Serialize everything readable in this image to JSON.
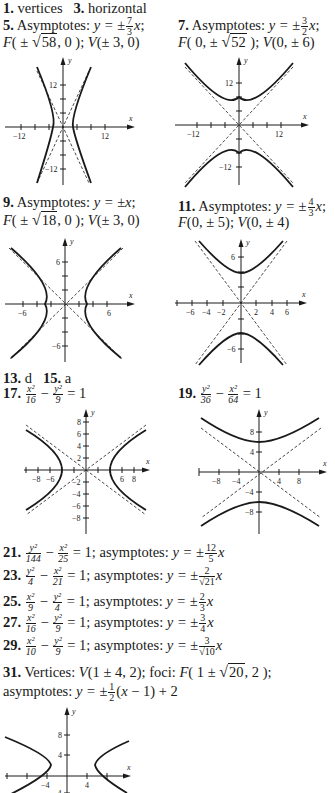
{
  "answers": [
    {
      "id": "1",
      "label": "1.",
      "text": "vertices"
    },
    {
      "id": "3",
      "label": "3.",
      "text": "horizontal"
    },
    {
      "id": "5",
      "label": "5.",
      "line1": "Asymptotes: y = ± 7/3 x;",
      "line2": "F(± √58, 0); V(± 3, 0)",
      "asym_num": "7",
      "asym_den": "3",
      "focus_root": "58",
      "vertex": "± 3, 0"
    },
    {
      "id": "7",
      "label": "7.",
      "line1": "Asymptotes: y = ± 3/2 x;",
      "line2": "F(0, ± √52); V(0, ± 6)",
      "asym_num": "3",
      "asym_den": "2",
      "focus_root": "52",
      "vertex": "0, ± 6"
    },
    {
      "id": "9",
      "label": "9.",
      "line1": "Asymptotes: y = ± x;",
      "line2": "F(± √18, 0); V(± 3, 0)",
      "focus_root": "18",
      "vertex": "± 3, 0"
    },
    {
      "id": "11",
      "label": "11.",
      "line1": "Asymptotes: y = ± 4/3 x;",
      "line2": "F(0, ± 5); V(0, ± 4)",
      "asym_num": "4",
      "asym_den": "3",
      "focus": "0, ± 5",
      "vertex": "0, ± 4"
    },
    {
      "id": "13",
      "label": "13.",
      "text": "d"
    },
    {
      "id": "15",
      "label": "15.",
      "text": "a"
    },
    {
      "id": "17",
      "label": "17.",
      "equation": "x²/16 − y²/9 = 1",
      "a_num": "x²",
      "a_den": "16",
      "b_num": "y²",
      "b_den": "9",
      "rhs": "= 1"
    },
    {
      "id": "19",
      "label": "19.",
      "equation": "y²/36 − x²/64 = 1",
      "a_num": "y²",
      "a_den": "36",
      "b_num": "x²",
      "b_den": "64",
      "rhs": "= 1"
    },
    {
      "id": "21",
      "label": "21.",
      "equation": "y²/144 − x²/25 = 1",
      "a_num": "y²",
      "a_den": "144",
      "b_num": "x²",
      "b_den": "25",
      "rhs": "= 1; asymptotes:",
      "asym": "y = ± 12/5 x",
      "asym_num": "12",
      "asym_den": "5"
    },
    {
      "id": "23",
      "label": "23.",
      "equation": "y²/4 − x²/21 = 1",
      "a_num": "y²",
      "a_den": "4",
      "b_num": "x²",
      "b_den": "21",
      "rhs": "= 1; asymptotes:",
      "asym": "y = ± 2/√21 x",
      "asym_num": "2",
      "asym_den": "√21"
    },
    {
      "id": "25",
      "label": "25.",
      "equation": "x²/9 − y²/4 = 1",
      "a_num": "x²",
      "a_den": "9",
      "b_num": "y²",
      "b_den": "4",
      "rhs": "= 1; asymptotes:",
      "asym": "y = ± 2/3 x",
      "asym_num": "2",
      "asym_den": "3"
    },
    {
      "id": "27",
      "label": "27.",
      "equation": "x²/16 − y²/9 = 1",
      "a_num": "x²",
      "a_den": "16",
      "b_num": "y²",
      "b_den": "9",
      "rhs": "= 1; asymptotes:",
      "asym": "y = ± 3/4 x",
      "asym_num": "3",
      "asym_den": "4"
    },
    {
      "id": "29",
      "label": "29.",
      "equation": "x²/10 − y²/9 = 1",
      "a_num": "x²",
      "a_den": "10",
      "b_num": "y²",
      "b_den": "9",
      "rhs": "= 1; asymptotes:",
      "asym": "y = ± 3/√10 x",
      "asym_num": "3",
      "asym_den": "√10"
    },
    {
      "id": "31",
      "label": "31.",
      "line1": "Vertices: V(1 ± 4, 2); foci: F(1 ± √20, 2);",
      "line2": "asymptotes: y = ± 1/2 (x − 1) + 2"
    }
  ],
  "words": {
    "asymptotes_cap": "Asymptotes:",
    "asymptotes": "asymptotes:",
    "vertices_cap": "Vertices:",
    "foci": "foci:",
    "y_eq": "y =",
    "pm": "±",
    "minus": "−",
    "x": "x",
    "y": "y"
  },
  "graphs": [
    {
      "id": "g5",
      "problem": "5",
      "orientation": "horizontal",
      "x_ticks": [
        "−12",
        "12"
      ],
      "y_ticks": [
        "12",
        "−12"
      ],
      "x_label": "x",
      "y_label": "y"
    },
    {
      "id": "g7",
      "problem": "7",
      "orientation": "vertical",
      "x_ticks": [
        "−12",
        "12"
      ],
      "y_ticks": [
        "12",
        "−12"
      ],
      "x_label": "x",
      "y_label": "y"
    },
    {
      "id": "g9",
      "problem": "9",
      "orientation": "horizontal",
      "x_ticks": [
        "−6",
        "6"
      ],
      "y_ticks": [
        "6",
        "−6"
      ],
      "x_label": "x",
      "y_label": "y"
    },
    {
      "id": "g11",
      "problem": "11",
      "orientation": "vertical",
      "x_ticks": [
        "−6",
        "−4",
        "−2",
        "2",
        "4",
        "6"
      ],
      "y_ticks": [
        "6",
        "−6"
      ],
      "x_label": "x",
      "y_label": "y"
    },
    {
      "id": "g17",
      "problem": "17",
      "orientation": "horizontal",
      "x_ticks": [
        "−8",
        "−6",
        "6",
        "8"
      ],
      "y_ticks": [
        "8",
        "6",
        "4",
        "2",
        "−2",
        "−4",
        "−6",
        "−8"
      ],
      "x_label": "x",
      "y_label": "y"
    },
    {
      "id": "g19",
      "problem": "19",
      "orientation": "vertical",
      "x_ticks": [
        "−8",
        "−4",
        "4",
        "8"
      ],
      "y_ticks": [
        "8",
        "4",
        "−4",
        "−8"
      ],
      "x_label": "x",
      "y_label": "y"
    },
    {
      "id": "g31",
      "problem": "31",
      "orientation": "horizontal",
      "x_ticks": [
        "−4",
        "4"
      ],
      "y_ticks": [
        "8",
        "4",
        "−4"
      ],
      "x_label": "x",
      "y_label": "y"
    }
  ]
}
